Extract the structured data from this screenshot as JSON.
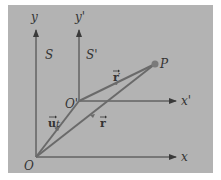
{
  "diagram": {
    "background_color": "#b3b3b3",
    "axis_color": "#3a3a3a",
    "vector_color": "#6a6a6a",
    "frames": [
      {
        "name": "S",
        "origin_label": "O",
        "x_label": "x",
        "y_label": "y",
        "frame_label": "S"
      },
      {
        "name": "S'",
        "origin_label": "O'",
        "x_label": "x'",
        "y_label": "y'",
        "frame_label": "S'"
      }
    ],
    "point_label": "P",
    "vectors": [
      {
        "name": "ut",
        "label_main": "u",
        "label_suffix": "t",
        "from": "O",
        "to": "O'"
      },
      {
        "name": "r",
        "label_main": "r",
        "from": "O",
        "to": "P"
      },
      {
        "name": "r'",
        "label_main": "r",
        "label_suffix": "′",
        "from": "O'",
        "to": "P"
      }
    ]
  }
}
